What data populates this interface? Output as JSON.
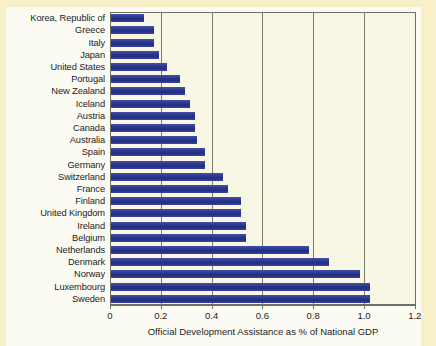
{
  "chart_data": {
    "type": "bar",
    "orientation": "horizontal",
    "title": "",
    "xlabel": "Official Development Assistance as % of National GDP",
    "ylabel": "",
    "xlim": [
      0,
      1.2
    ],
    "xticks": [
      "0",
      "0.2",
      "0.4",
      "0.6",
      "0.8",
      "1.0",
      "1.2"
    ],
    "xtick_values": [
      0,
      0.2,
      0.4,
      0.6,
      0.8,
      1.0,
      1.2
    ],
    "grid": "vertical",
    "legend": "none",
    "bar_color": "#2e3b8f",
    "plot_background": "#f8f6e4",
    "figure_background": "#f7f0c8",
    "categories": [
      "Korea, Republic of",
      "Greece",
      "Italy",
      "Japan",
      "United States",
      "Portugal",
      "New Zealand",
      "Iceland",
      "Austria",
      "Canada",
      "Australia",
      "Spain",
      "Germany",
      "Switzerland",
      "France",
      "Finland",
      "United Kingdom",
      "Ireland",
      "Belgium",
      "Netherlands",
      "Denmark",
      "Norway",
      "Luxembourg",
      "Sweden"
    ],
    "values": [
      0.13,
      0.17,
      0.17,
      0.19,
      0.22,
      0.27,
      0.29,
      0.31,
      0.33,
      0.33,
      0.34,
      0.37,
      0.37,
      0.44,
      0.46,
      0.51,
      0.51,
      0.53,
      0.53,
      0.78,
      0.86,
      0.98,
      1.02,
      1.02
    ]
  }
}
